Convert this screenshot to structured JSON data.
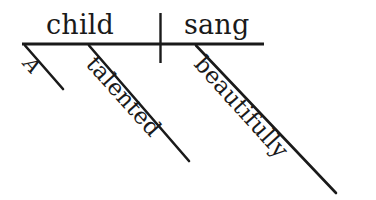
{
  "diagram": {
    "type": "reed-kellogg-sentence-diagram",
    "sentence": "A talented child sang beautifully.",
    "background_color": "#ffffff",
    "ink_color": "#1a1a1a",
    "baseline": {
      "label": "horizontal-baseline",
      "x1": 22,
      "y1": 44,
      "x2": 264,
      "y2": 44,
      "stroke_width": 3.2
    },
    "divider": {
      "label": "subject-verb-divider",
      "x1": 160.5,
      "y1": 13,
      "x2": 160.5,
      "y2": 63,
      "stroke_width": 2.4
    },
    "main_words": [
      {
        "id": "subject",
        "text": "child",
        "role": "subject-noun",
        "x": 46,
        "y": 11
      },
      {
        "id": "verb",
        "text": "sang",
        "role": "predicate-verb",
        "x": 184,
        "y": 11
      }
    ],
    "modifiers": [
      {
        "id": "article",
        "text": "A",
        "role": "article-modifying-child",
        "italic": true,
        "line": {
          "x1": 25,
          "y1": 45.5,
          "x2": 63,
          "y2": 89
        },
        "stroke_width": 2.6,
        "angle_deg": 48
      },
      {
        "id": "adjective",
        "text": "talented",
        "role": "adjective-modifying-child",
        "italic": false,
        "line": {
          "x1": 89,
          "y1": 45.5,
          "x2": 189,
          "y2": 161
        },
        "stroke_width": 2.6,
        "angle_deg": 48
      },
      {
        "id": "adverb",
        "text": "beautifully",
        "role": "adverb-modifying-sang",
        "italic": false,
        "line": {
          "x1": 196,
          "y1": 45.5,
          "x2": 336,
          "y2": 193
        },
        "stroke_width": 2.6,
        "angle_deg": 48
      }
    ]
  }
}
